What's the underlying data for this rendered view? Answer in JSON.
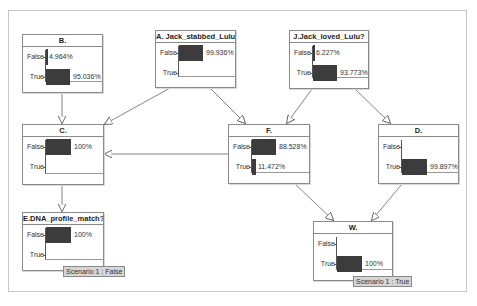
{
  "diagram": {
    "type": "bayesian-network",
    "nodes": [
      {
        "id": "B",
        "title": "B.",
        "states": [
          {
            "label": "False",
            "value": 4.964,
            "text": "4.964%"
          },
          {
            "label": "True",
            "value": 95.036,
            "text": "95.036%"
          }
        ]
      },
      {
        "id": "A",
        "title": "A. Jack_stabbed_Lulu?",
        "states": [
          {
            "label": "False",
            "value": 99.936,
            "text": "99.936%"
          },
          {
            "label": "True",
            "value": 0.064,
            "text": ""
          }
        ]
      },
      {
        "id": "J",
        "title": "J.Jack_loved_Lulu?",
        "states": [
          {
            "label": "False",
            "value": 6.227,
            "text": "6.227%"
          },
          {
            "label": "True",
            "value": 93.773,
            "text": "93.773%"
          }
        ]
      },
      {
        "id": "C",
        "title": "C.",
        "states": [
          {
            "label": "False",
            "value": 100,
            "text": "100%"
          },
          {
            "label": "True",
            "value": 0,
            "text": ""
          }
        ]
      },
      {
        "id": "F",
        "title": "F.",
        "states": [
          {
            "label": "False",
            "value": 88.528,
            "text": "88.528%"
          },
          {
            "label": "True",
            "value": 11.472,
            "text": "11.472%"
          }
        ]
      },
      {
        "id": "D",
        "title": "D.",
        "states": [
          {
            "label": "False",
            "value": 0.103,
            "text": ""
          },
          {
            "label": "True",
            "value": 99.897,
            "text": "99.897%"
          }
        ]
      },
      {
        "id": "E",
        "title": "E.DNA_profile_match?",
        "states": [
          {
            "label": "False",
            "value": 100,
            "text": "100%"
          },
          {
            "label": "True",
            "value": 0,
            "text": ""
          }
        ],
        "scenario": "Scenario 1 : False"
      },
      {
        "id": "W",
        "title": "W.",
        "states": [
          {
            "label": "False",
            "value": 0,
            "text": ""
          },
          {
            "label": "True",
            "value": 100,
            "text": "100%"
          }
        ],
        "scenario": "Scenario 1 : True"
      }
    ],
    "edges": [
      {
        "from": "B",
        "to": "C"
      },
      {
        "from": "A",
        "to": "C"
      },
      {
        "from": "A",
        "to": "F"
      },
      {
        "from": "J",
        "to": "F"
      },
      {
        "from": "J",
        "to": "D"
      },
      {
        "from": "F",
        "to": "C"
      },
      {
        "from": "C",
        "to": "E"
      },
      {
        "from": "F",
        "to": "W"
      },
      {
        "from": "D",
        "to": "W"
      }
    ],
    "colors": {
      "bar": "#3c3c3c",
      "border": "#8a8a8a",
      "tag_bg": "#d6d6d6"
    }
  }
}
